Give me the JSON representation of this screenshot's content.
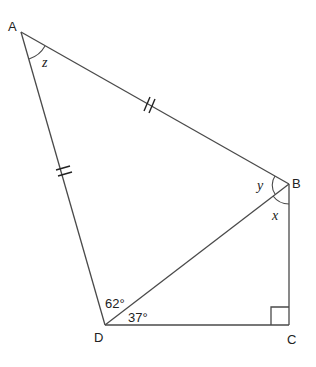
{
  "diagram": {
    "type": "geometry-figure",
    "vertices": {
      "A": {
        "label": "A",
        "x": 21,
        "y": 32
      },
      "B": {
        "label": "B",
        "x": 289,
        "y": 184
      },
      "C": {
        "label": "C",
        "x": 289,
        "y": 325
      },
      "D": {
        "label": "D",
        "x": 105,
        "y": 325
      }
    },
    "segments": [
      "AB",
      "BC",
      "CD",
      "DA",
      "BD"
    ],
    "equal_marks": {
      "AB": "double-tick",
      "AD": "double-tick"
    },
    "right_angle_at": "C",
    "angle_labels": {
      "z": "z",
      "y": "y",
      "x": "x",
      "adb": "62°",
      "bdc": "37°"
    }
  }
}
